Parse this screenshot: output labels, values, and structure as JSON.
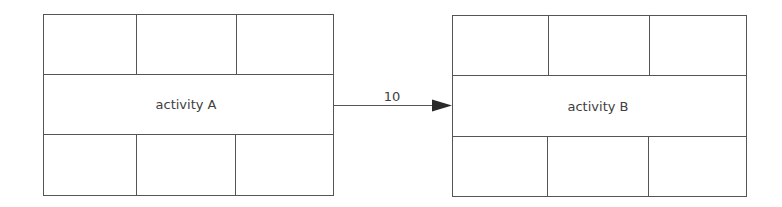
{
  "diagram": {
    "type": "activity-on-node network",
    "nodes": [
      {
        "id": "A",
        "label": "activity A",
        "top_cells": [
          "",
          "",
          ""
        ],
        "bottom_cells": [
          "",
          "",
          ""
        ]
      },
      {
        "id": "B",
        "label": "activity B",
        "top_cells": [
          "",
          "",
          ""
        ],
        "bottom_cells": [
          "",
          "",
          ""
        ]
      }
    ],
    "edges": [
      {
        "from": "A",
        "to": "B",
        "label": "10"
      }
    ]
  }
}
